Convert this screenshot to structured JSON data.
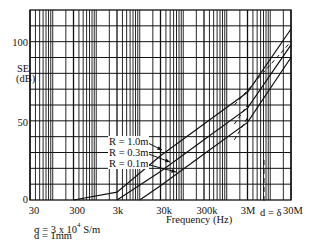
{
  "chart_data": {
    "type": "line",
    "title": "",
    "xlabel": "Frequency (Hz)",
    "ylabel": "SE (dB)",
    "xscale": "log",
    "xlim": [
      30,
      30000000
    ],
    "ylim": [
      0,
      120
    ],
    "grid": true,
    "x_ticks": [
      "30",
      "300",
      "3k",
      "30k",
      "300k",
      "3M",
      "30M"
    ],
    "y_ticks": [
      "0",
      "50",
      "100"
    ],
    "series": [
      {
        "name": "R = 1.0m",
        "style": "solid",
        "x": [
          300,
          3000,
          30000,
          300000,
          3000000,
          30000000
        ],
        "y": [
          0,
          5,
          28,
          48,
          68,
          108
        ]
      },
      {
        "name": "R = 0.3m",
        "style": "solid",
        "x": [
          3000,
          30000,
          300000,
          3000000,
          30000000
        ],
        "y": [
          0,
          18,
          38,
          58,
          98
        ]
      },
      {
        "name": "R = 0.1m",
        "style": "solid",
        "x": [
          10000,
          30000,
          300000,
          3000000,
          30000000
        ],
        "y": [
          0,
          9,
          29,
          49,
          90
        ]
      }
    ],
    "dashed_extensions": [
      {
        "series": "R = 1.0m",
        "x": [
          1500000,
          30000000
        ],
        "y": [
          60,
          100
        ]
      },
      {
        "series": "R = 0.3m",
        "x": [
          1500000,
          3000000
        ],
        "y": [
          48,
          60
        ]
      },
      {
        "series": "R = 0.1m",
        "x": [
          1500000,
          3000000
        ],
        "y": [
          38,
          52
        ]
      }
    ],
    "annotations": [
      {
        "text": "σ = 3 x 10⁴ S/m"
      },
      {
        "text": "d = 1mm"
      },
      {
        "text": "d = δ",
        "marker": "dashed vertical line near 6 MHz"
      }
    ],
    "legend": {
      "position": "inline-center",
      "entries": [
        "R = 1.0m",
        "R = 0.3m",
        "R = 0.1m"
      ]
    }
  },
  "labels": {
    "y_axis_title_1": "SE",
    "y_axis_title_2": "(dB)",
    "x_axis_title": "Frequency (Hz)",
    "sigma_note_a": "σ = 3 x 10",
    "sigma_note_exp": "4",
    "sigma_note_b": " S/m",
    "thickness_note": "d = 1mm",
    "skin_depth_note": "d = δ",
    "legend_r1": "R = 1.0m",
    "legend_r2": "R = 0.3m",
    "legend_r3": "R = 0.1m",
    "y_100": "100",
    "y_50": "50",
    "y_0": "0",
    "x_30": "30",
    "x_300": "300",
    "x_3k": "3k",
    "x_30k": "30k",
    "x_300k": "300k",
    "x_3M": "3M",
    "x_30M": "30M"
  }
}
